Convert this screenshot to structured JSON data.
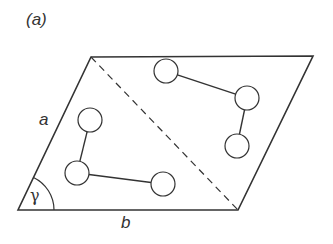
{
  "figure": {
    "panel_label": "(a)",
    "labels": {
      "side_a": "a",
      "side_b": "b",
      "angle": "γ"
    },
    "unit_cell": {
      "shape": "parallelogram",
      "vertices": {
        "bottom_left": [
          18,
          210
        ],
        "bottom_right": [
          238,
          210
        ],
        "top_right": [
          313,
          56
        ],
        "top_left": [
          91,
          57
        ]
      },
      "diagonal": {
        "style": "dashed",
        "from": "top_left",
        "to": "bottom_right"
      }
    },
    "molecules": [
      {
        "name": "molecule-lower-left",
        "atoms": [
          [
            90,
            120
          ],
          [
            77,
            173
          ],
          [
            163,
            184
          ]
        ],
        "bonds": [
          [
            0,
            1
          ],
          [
            1,
            2
          ]
        ]
      },
      {
        "name": "molecule-upper-right",
        "atoms": [
          [
            166,
            71
          ],
          [
            247,
            98
          ],
          [
            237,
            146
          ]
        ],
        "bonds": [
          [
            0,
            1
          ],
          [
            1,
            2
          ]
        ]
      }
    ],
    "atom_radius": 12,
    "colors": {
      "stroke": "#333333",
      "background": "#ffffff"
    }
  }
}
